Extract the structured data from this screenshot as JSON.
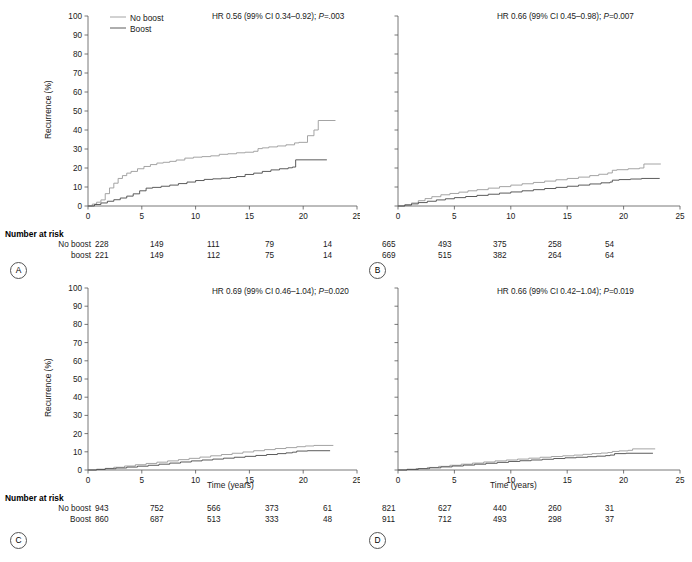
{
  "figure": {
    "axis_label_y": "Recurrence (%)",
    "axis_label_x": "Time (years)",
    "risk_table_title": "Number at risk",
    "legend": {
      "noboost": "No boost",
      "boost": "Boost"
    }
  },
  "panels": {
    "A": {
      "letter": "A",
      "hr_text": "HR 0.56 (99% CI 0.34–0.92); P=.003",
      "hr_prefix": "HR 0.56 (99% CI 0.34–0.92); ",
      "hr_p_italic": "P",
      "hr_suffix": "=.003",
      "risk_labels": [
        "No boost",
        "boost"
      ],
      "risk_noboost": [
        "228",
        "149",
        "111",
        "79",
        "14"
      ],
      "risk_boost": [
        "221",
        "149",
        "112",
        "75",
        "14"
      ]
    },
    "B": {
      "letter": "B",
      "hr_text": "HR 0.66 (99% CI 0.45–0.98); P=0.007",
      "hr_prefix": "HR 0.66 (99% CI 0.45–0.98); ",
      "hr_p_italic": "P",
      "hr_suffix": "=0.007",
      "risk_labels": [
        "No boost",
        "Boost"
      ],
      "risk_noboost": [
        "665",
        "493",
        "375",
        "258",
        "54"
      ],
      "risk_boost": [
        "669",
        "515",
        "382",
        "264",
        "64"
      ]
    },
    "C": {
      "letter": "C",
      "hr_text": "HR 0.69 (99% CI 0.46–1.04); P=0.020",
      "hr_prefix": "HR 0.69 (99% CI 0.46–1.04); ",
      "hr_p_italic": "P",
      "hr_suffix": "=0.020",
      "risk_labels": [
        "No boost",
        "Boost"
      ],
      "risk_noboost": [
        "943",
        "752",
        "566",
        "373",
        "61"
      ],
      "risk_boost": [
        "860",
        "687",
        "513",
        "333",
        "48"
      ]
    },
    "D": {
      "letter": "D",
      "hr_text": "HR 0.66 (99% CI 0.42–1.04); P=0.019",
      "hr_prefix": "HR 0.66 (99% CI 0.42–1.04); ",
      "hr_p_italic": "P",
      "hr_suffix": "=0.019",
      "risk_labels": [
        "No boost",
        "Boost"
      ],
      "risk_noboost": [
        "821",
        "627",
        "440",
        "260",
        "31"
      ],
      "risk_boost": [
        "911",
        "712",
        "493",
        "298",
        "37"
      ]
    }
  },
  "chart_data": {
    "type": "line",
    "title": "",
    "xlabel": "Time (years)",
    "ylabel": "Recurrence (%)",
    "xlim": [
      0,
      25
    ],
    "ylim": [
      0,
      100
    ],
    "xticks": [
      0,
      5,
      10,
      15,
      20,
      25
    ],
    "yticks": [
      0,
      10,
      20,
      30,
      40,
      50,
      60,
      70,
      80,
      90,
      100
    ],
    "grid": false,
    "legend_position": "top-left",
    "colors": {
      "no_boost": "#9a9a9a",
      "boost": "#4a4a4a"
    },
    "risk_times": [
      0,
      5,
      10,
      15,
      20
    ],
    "panels": [
      {
        "id": "A",
        "hr": 0.56,
        "ci_low": 0.34,
        "ci_high": 0.92,
        "p_value": ".003",
        "series": [
          {
            "name": "No boost",
            "x": [
              0,
              0.4,
              0.8,
              1.2,
              1.6,
              2.0,
              2.4,
              2.8,
              3.2,
              3.6,
              4.0,
              4.6,
              5.2,
              5.8,
              6.4,
              7.0,
              7.6,
              8.2,
              9.0,
              9.8,
              10.6,
              11.4,
              12.2,
              13.0,
              13.8,
              14.6,
              15.4,
              15.8,
              16.2,
              16.8,
              17.6,
              18.4,
              19.2,
              19.6,
              20.4,
              21.0,
              21.4,
              23.0
            ],
            "y": [
              0,
              1.0,
              2.0,
              3.2,
              6.5,
              9.5,
              12.0,
              14.5,
              16.0,
              17.3,
              18.2,
              19.6,
              20.8,
              21.8,
              22.6,
              23.0,
              23.5,
              24.2,
              25.2,
              25.7,
              26.0,
              26.4,
              27.2,
              27.5,
              28.0,
              28.3,
              28.8,
              30.2,
              30.6,
              31.1,
              31.6,
              32.2,
              33.2,
              33.5,
              37.0,
              40.0,
              45.0,
              45.0
            ]
          },
          {
            "name": "Boost",
            "x": [
              0,
              0.6,
              1.2,
              1.8,
              2.4,
              3.0,
              3.6,
              4.2,
              4.8,
              5.4,
              6.0,
              6.8,
              7.6,
              8.4,
              9.2,
              10.0,
              10.8,
              11.6,
              12.4,
              13.2,
              13.8,
              14.6,
              15.4,
              16.2,
              17.0,
              17.8,
              18.6,
              19.0,
              19.3,
              22.2
            ],
            "y": [
              0,
              0.8,
              1.6,
              2.5,
              3.3,
              4.2,
              5.2,
              6.4,
              8.0,
              9.4,
              9.8,
              10.4,
              11.0,
              11.8,
              12.6,
              13.4,
              14.0,
              14.3,
              14.6,
              15.0,
              15.5,
              16.6,
              17.3,
              18.2,
              19.0,
              19.6,
              20.1,
              20.5,
              24.3,
              24.3
            ]
          }
        ]
      },
      {
        "id": "B",
        "hr": 0.66,
        "ci_low": 0.45,
        "ci_high": 0.98,
        "p_value": "0.007",
        "series": [
          {
            "name": "No boost",
            "x": [
              0,
              0.6,
              1.2,
              1.8,
              2.4,
              3.0,
              3.8,
              4.6,
              5.4,
              6.2,
              7.0,
              8.0,
              9.0,
              10.0,
              11.0,
              12.0,
              13.0,
              14.0,
              15.0,
              16.0,
              17.0,
              17.8,
              18.6,
              19.0,
              19.4,
              20.4,
              21.4,
              21.8,
              23.3
            ],
            "y": [
              0,
              0.7,
              1.6,
              2.8,
              3.9,
              4.9,
              5.9,
              6.6,
              7.3,
              8.0,
              8.6,
              9.4,
              10.2,
              11.0,
              11.7,
              12.4,
              13.1,
              13.8,
              14.5,
              15.2,
              16.0,
              16.7,
              17.4,
              18.8,
              19.1,
              19.6,
              20.0,
              22.1,
              22.1
            ]
          },
          {
            "name": "Boost",
            "x": [
              0,
              0.6,
              1.2,
              1.8,
              2.6,
              3.4,
              4.2,
              5.0,
              6.0,
              7.0,
              8.0,
              9.0,
              10.0,
              11.0,
              12.0,
              13.0,
              14.0,
              15.0,
              16.0,
              17.0,
              18.0,
              18.8,
              19.0,
              19.6,
              20.6,
              21.6,
              23.2
            ],
            "y": [
              0,
              0.5,
              1.1,
              1.8,
              2.5,
              3.2,
              3.8,
              4.4,
              5.0,
              5.6,
              6.2,
              6.8,
              7.4,
              8.0,
              8.6,
              9.2,
              9.8,
              10.4,
              11.0,
              11.6,
              12.2,
              12.6,
              13.6,
              13.9,
              14.2,
              14.5,
              14.5
            ]
          }
        ]
      },
      {
        "id": "C",
        "hr": 0.69,
        "ci_low": 0.46,
        "ci_high": 1.04,
        "p_value": "0.020",
        "series": [
          {
            "name": "No boost",
            "x": [
              0,
              0.8,
              1.6,
              2.4,
              3.4,
              4.4,
              5.4,
              6.4,
              7.4,
              8.4,
              9.4,
              10.4,
              11.4,
              12.4,
              13.4,
              14.4,
              15.4,
              16.4,
              17.4,
              18.4,
              19.4,
              20.2,
              21.0,
              22.8
            ],
            "y": [
              0,
              0.4,
              0.9,
              1.5,
              2.2,
              2.9,
              3.6,
              4.3,
              5.0,
              5.7,
              6.4,
              7.1,
              7.8,
              8.5,
              9.2,
              9.9,
              10.6,
              11.2,
              11.8,
              12.3,
              12.8,
              13.2,
              13.5,
              13.5
            ]
          },
          {
            "name": "Boost",
            "x": [
              0,
              0.8,
              1.6,
              2.6,
              3.6,
              4.6,
              5.6,
              6.6,
              7.6,
              8.6,
              9.6,
              10.6,
              11.6,
              12.6,
              13.6,
              14.6,
              15.6,
              16.6,
              17.6,
              18.4,
              19.0,
              19.4,
              20.4,
              22.5
            ],
            "y": [
              0,
              0.3,
              0.7,
              1.1,
              1.6,
              2.1,
              2.6,
              3.2,
              3.8,
              4.4,
              5.0,
              5.5,
              6.0,
              6.5,
              7.0,
              7.5,
              8.0,
              8.5,
              9.0,
              9.4,
              9.8,
              10.4,
              10.6,
              10.6
            ]
          }
        ]
      },
      {
        "id": "D",
        "hr": 0.66,
        "ci_low": 0.42,
        "ci_high": 1.04,
        "p_value": "0.019",
        "series": [
          {
            "name": "No boost",
            "x": [
              0,
              0.8,
              1.6,
              2.6,
              3.6,
              4.6,
              5.6,
              6.6,
              7.6,
              8.6,
              9.6,
              10.6,
              11.6,
              12.6,
              13.6,
              14.6,
              15.6,
              16.4,
              17.2,
              18.0,
              18.6,
              19.0,
              19.6,
              20.4,
              20.8,
              22.8
            ],
            "y": [
              0,
              0.4,
              0.8,
              1.4,
              2.0,
              2.6,
              3.2,
              3.8,
              4.4,
              5.0,
              5.5,
              6.0,
              6.5,
              7.0,
              7.4,
              7.8,
              8.2,
              8.6,
              9.0,
              9.3,
              9.6,
              10.2,
              10.5,
              10.8,
              11.6,
              11.6
            ]
          },
          {
            "name": "Boost",
            "x": [
              0,
              0.8,
              1.8,
              2.8,
              3.8,
              4.8,
              5.8,
              6.8,
              7.8,
              8.8,
              9.8,
              10.8,
              11.8,
              12.8,
              13.8,
              14.8,
              15.8,
              16.8,
              17.6,
              18.4,
              18.8,
              19.2,
              20.2,
              22.6
            ],
            "y": [
              0,
              0.3,
              0.7,
              1.2,
              1.7,
              2.2,
              2.7,
              3.2,
              3.7,
              4.2,
              4.7,
              5.1,
              5.5,
              5.9,
              6.3,
              6.7,
              7.0,
              7.3,
              7.6,
              7.9,
              8.2,
              9.0,
              9.2,
              9.2
            ]
          }
        ]
      }
    ]
  }
}
